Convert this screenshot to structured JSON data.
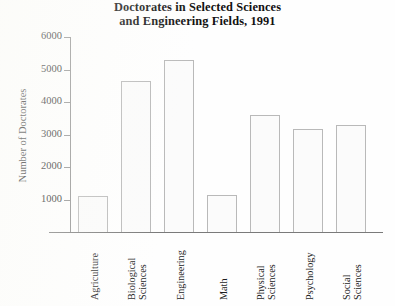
{
  "chart_data": {
    "type": "bar",
    "title": "Doctorates in Selected Sciences and Engineering Fields, 1991",
    "title_lines": [
      "Doctorates in Selected Sciences",
      "and Engineering Fields, 1991"
    ],
    "xlabel": "",
    "ylabel": "Number of Doctorates",
    "ylim": [
      0,
      6000
    ],
    "ytick_values": [
      1000,
      2000,
      3000,
      4000,
      5000,
      6000
    ],
    "ytick_labels": [
      "1000",
      "2000",
      "3000",
      "4000",
      "5000",
      "6000"
    ],
    "grid": false,
    "legend": false,
    "categories": [
      "Agriculture",
      "Biological Sciences",
      "Engineering",
      "Math",
      "Physical Sciences",
      "Psychology",
      "Social Sciences"
    ],
    "category_label_lines": [
      [
        "Agriculture"
      ],
      [
        "Biological",
        "Sciences"
      ],
      [
        "Engineering"
      ],
      [
        "Math"
      ],
      [
        "Physical",
        "Sciences"
      ],
      [
        "Psychology"
      ],
      [
        "Social",
        "Sciences"
      ]
    ],
    "values": [
      1100,
      4650,
      5300,
      1150,
      3600,
      3180,
      3300
    ],
    "bar_fill_color": "#fbfbfb",
    "bar_border_color": "#b9b9b9",
    "axis_color": "#8d8d8d",
    "text_color": "#1d1d1d",
    "background_color": "#fefefe"
  }
}
